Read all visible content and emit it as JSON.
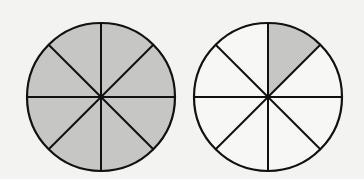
{
  "figure": {
    "colors": {
      "background": "#f3f3f1",
      "shaded": "#c6c6c4",
      "unshaded": "#f7f7f5",
      "stroke": "#111111"
    },
    "circles": [
      {
        "id": "left-circle",
        "cx": 101,
        "cy": 97,
        "r": 74,
        "divisions": 8,
        "shaded_sectors": [
          0,
          1,
          2,
          3,
          4,
          5,
          6,
          7
        ],
        "fraction_shaded": "8/8"
      },
      {
        "id": "right-circle",
        "cx": 268,
        "cy": 97,
        "r": 74,
        "divisions": 8,
        "shaded_sectors": [
          0
        ],
        "fraction_shaded": "1/8"
      }
    ]
  }
}
